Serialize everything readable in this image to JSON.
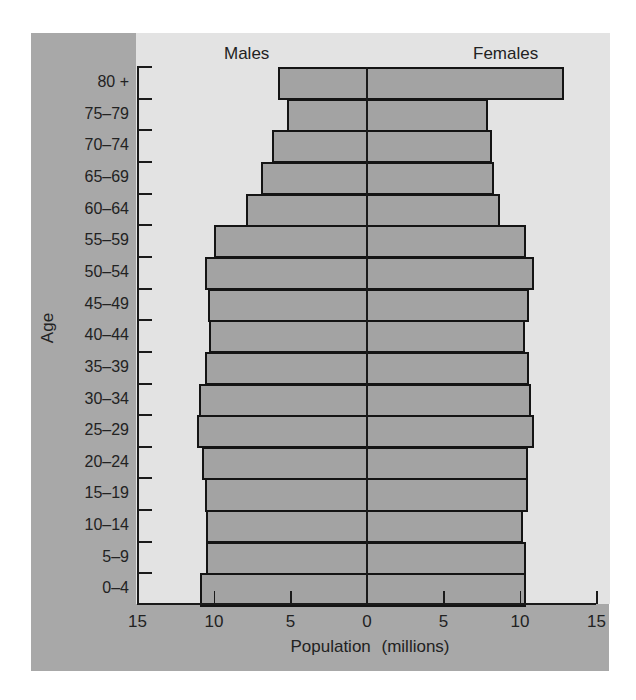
{
  "chart_data": {
    "type": "bar",
    "orientation": "horizontal",
    "subtype": "population-pyramid",
    "title": "",
    "xlabel": "Population (millions)",
    "ylabel": "Age",
    "xlim": [
      -15,
      15
    ],
    "x_ticks": [
      15,
      10,
      5,
      0,
      5,
      10,
      15
    ],
    "grid": false,
    "legend": null,
    "side_labels": {
      "left": "Males",
      "right": "Females"
    },
    "categories": [
      "80+",
      "75–79",
      "70–74",
      "65–69",
      "60–64",
      "55–59",
      "50–54",
      "45–49",
      "40–44",
      "35–39",
      "30–34",
      "25–29",
      "20–24",
      "15–19",
      "10–14",
      "5–9",
      "0–4"
    ],
    "series": [
      {
        "name": "Males",
        "values": [
          5.8,
          5.2,
          6.2,
          6.9,
          7.9,
          10.0,
          10.6,
          10.4,
          10.3,
          10.6,
          11.0,
          11.1,
          10.8,
          10.6,
          10.5,
          10.5,
          10.9
        ]
      },
      {
        "name": "Females",
        "values": [
          12.9,
          7.9,
          8.2,
          8.3,
          8.7,
          10.4,
          10.9,
          10.6,
          10.3,
          10.6,
          10.7,
          10.9,
          10.5,
          10.5,
          10.2,
          10.4,
          10.4
        ]
      }
    ]
  },
  "headers": {
    "left": "Males",
    "right": "Females"
  },
  "axis": {
    "y_title": "Age",
    "x_title": "Population  (millions)",
    "x_tick_labels": [
      "15",
      "10",
      "5",
      "0",
      "5",
      "10",
      "15"
    ],
    "y_tick_labels": [
      "80 +",
      "75–79",
      "70–74",
      "65–69",
      "60–64",
      "55–59",
      "50–54",
      "45–49",
      "40–44",
      "35–39",
      "30–34",
      "25–29",
      "20–24",
      "15–19",
      "10–14",
      "5–9",
      "0–4"
    ]
  },
  "colors": {
    "bar": "#a3a3a3",
    "plot_bg": "#e3e3e3",
    "frame": "#a8a8a8",
    "outline": "#141414"
  }
}
